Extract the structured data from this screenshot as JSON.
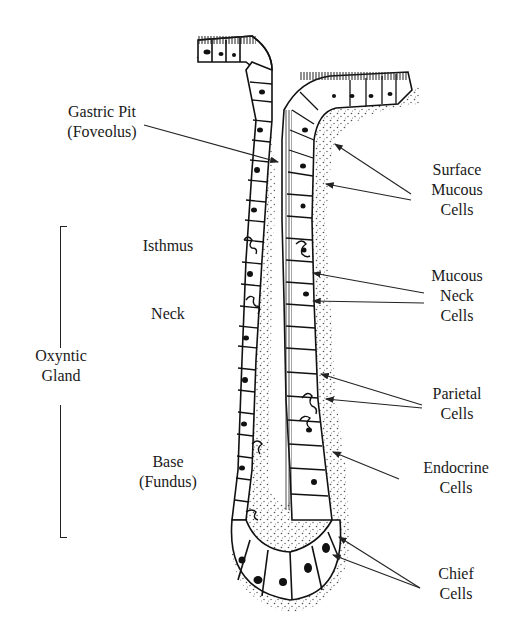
{
  "figure": {
    "colors": {
      "ink": "#1a1a1a",
      "background": "#ffffff"
    }
  },
  "labels": {
    "gastric_pit": {
      "line1": "Gastric Pit",
      "line2": "(Foveolus)"
    },
    "isthmus": "Isthmus",
    "neck": "Neck",
    "oxyntic_gland": {
      "line1": "Oxyntic",
      "line2": "Gland"
    },
    "base": {
      "line1": "Base",
      "line2": "(Fundus)"
    },
    "surface_mucous": {
      "line1": "Surface",
      "line2": "Mucous",
      "line3": "Cells"
    },
    "mucous_neck": {
      "line1": "Mucous",
      "line2": "Neck",
      "line3": "Cells"
    },
    "parietal": {
      "line1": "Parietal",
      "line2": "Cells"
    },
    "endocrine": {
      "line1": "Endocrine",
      "line2": "Cells"
    },
    "chief": {
      "line1": "Chief",
      "line2": "Cells"
    }
  },
  "pointers": [
    {
      "target": "gastric-pit",
      "from": [
        144,
        125
      ],
      "to": [
        278,
        162
      ]
    },
    {
      "target": "surface-mucous-cell-1",
      "from": [
        411,
        194
      ],
      "to": [
        335,
        144
      ]
    },
    {
      "target": "surface-mucous-cell-2",
      "from": [
        411,
        200
      ],
      "to": [
        326,
        184
      ]
    },
    {
      "target": "mucous-neck-cell-1",
      "from": [
        424,
        293
      ],
      "to": [
        313,
        273
      ]
    },
    {
      "target": "mucous-neck-cell-2",
      "from": [
        424,
        303
      ],
      "to": [
        313,
        301
      ]
    },
    {
      "target": "parietal-cell-1",
      "from": [
        422,
        405
      ],
      "to": [
        321,
        374
      ]
    },
    {
      "target": "parietal-cell-2",
      "from": [
        422,
        408
      ],
      "to": [
        326,
        399
      ]
    },
    {
      "target": "endocrine-cell",
      "from": [
        399,
        479
      ],
      "to": [
        333,
        452
      ]
    },
    {
      "target": "chief-cell-1",
      "from": [
        420,
        588
      ],
      "to": [
        339,
        537
      ]
    },
    {
      "target": "chief-cell-2",
      "from": [
        420,
        588
      ],
      "to": [
        333,
        555
      ]
    }
  ]
}
